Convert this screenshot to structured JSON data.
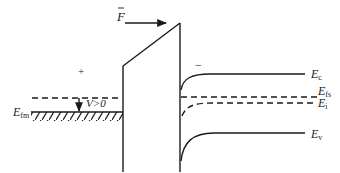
{
  "diagram": {
    "colors": {
      "line": "#1a1a1a",
      "background": "#ffffff"
    },
    "field": {
      "label": "F",
      "vector_marker": "→"
    },
    "metal": {
      "fermi_label": "E",
      "fermi_sub": "fm",
      "charge_sign": "+",
      "bias_label": "V>0"
    },
    "semiconductor": {
      "charge_sign": "−",
      "bands": [
        {
          "id": "Ec",
          "label": "E",
          "sub": "c",
          "style": "solid"
        },
        {
          "id": "Efs",
          "label": "E",
          "sub": "fs",
          "style": "dashed"
        },
        {
          "id": "Ei",
          "label": "E",
          "sub": "i",
          "style": "dashed"
        },
        {
          "id": "Ev",
          "label": "E",
          "sub": "v",
          "style": "solid"
        }
      ]
    }
  }
}
